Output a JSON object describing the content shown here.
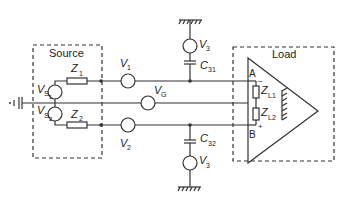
{
  "diagram": {
    "type": "circuit-schematic",
    "title": "",
    "colors": {
      "stroke": "#333333",
      "background": "#ffffff"
    },
    "source_box": {
      "label": "Source"
    },
    "load_box": {
      "label": "Load"
    },
    "components": {
      "vs1": {
        "main": "V",
        "sub": "S",
        "subsub": "1"
      },
      "vs2": {
        "main": "V",
        "sub": "S",
        "subsub": "2"
      },
      "z1": {
        "main": "Z",
        "sub": "1"
      },
      "z2": {
        "main": "Z",
        "sub": "2"
      },
      "v1": {
        "main": "V",
        "sub": "1"
      },
      "v2": {
        "main": "V",
        "sub": "2"
      },
      "vg": {
        "main": "V",
        "sub": "G"
      },
      "v3_top": {
        "main": "V",
        "sub": "3"
      },
      "v3_bottom": {
        "main": "V",
        "sub": "3"
      },
      "c31": {
        "main": "C",
        "sub": "31"
      },
      "c32": {
        "main": "C",
        "sub": "32"
      },
      "zl1": {
        "main": "Z",
        "sub": "L1"
      },
      "zl2": {
        "main": "Z",
        "sub": "L2"
      }
    },
    "terminals": {
      "a": "A",
      "b": "B",
      "minus": "−",
      "plus": "+"
    }
  }
}
